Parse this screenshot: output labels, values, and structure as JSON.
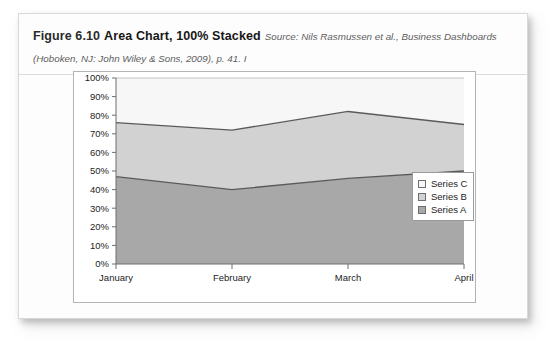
{
  "figure": {
    "number": "Figure 6.10",
    "title": "Area Chart, 100% Stacked",
    "source_line1": "Source: Nils Rasmussen et al., Business Dashboards",
    "source_line2": "(Hoboken, NJ: John Wiley & Sons, 2009), p. 41. I"
  },
  "legend": {
    "position": "right",
    "items": [
      {
        "label": "Series C",
        "color": "#f7f7f7"
      },
      {
        "label": "Series B",
        "color": "#d2d2d2"
      },
      {
        "label": "Series A",
        "color": "#a8a8a8"
      }
    ]
  },
  "colors": {
    "series_a": "#a8a8a8",
    "series_b": "#d2d2d2",
    "series_c": "#f7f7f7",
    "line": "#5a5a5a",
    "axis": "#6e6e6e",
    "frame": "#b4b4b4",
    "card_border": "#d8d8d8",
    "text": "#1d1d1d"
  },
  "chart_data": {
    "type": "area",
    "stacked": "100%",
    "title": "",
    "xlabel": "",
    "ylabel": "",
    "categories": [
      "January",
      "February",
      "March",
      "April"
    ],
    "ylim": [
      0,
      100
    ],
    "ytick_labels": [
      "0%",
      "10%",
      "20%",
      "30%",
      "40%",
      "50%",
      "60%",
      "70%",
      "80%",
      "90%",
      "100%"
    ],
    "ytick_values": [
      0,
      10,
      20,
      30,
      40,
      50,
      60,
      70,
      80,
      90,
      100
    ],
    "grid": false,
    "series": [
      {
        "name": "Series A",
        "values": [
          47,
          40,
          46,
          50
        ]
      },
      {
        "name": "Series B",
        "values": [
          29,
          32,
          36,
          25
        ]
      },
      {
        "name": "Series C",
        "values": [
          24,
          28,
          18,
          25
        ]
      }
    ],
    "cumulative": [
      {
        "name": "Series A",
        "values": [
          47,
          40,
          46,
          50
        ]
      },
      {
        "name": "Series A+B",
        "values": [
          76,
          72,
          82,
          75
        ]
      },
      {
        "name": "Series A+B+C",
        "values": [
          100,
          100,
          100,
          100
        ]
      }
    ]
  }
}
